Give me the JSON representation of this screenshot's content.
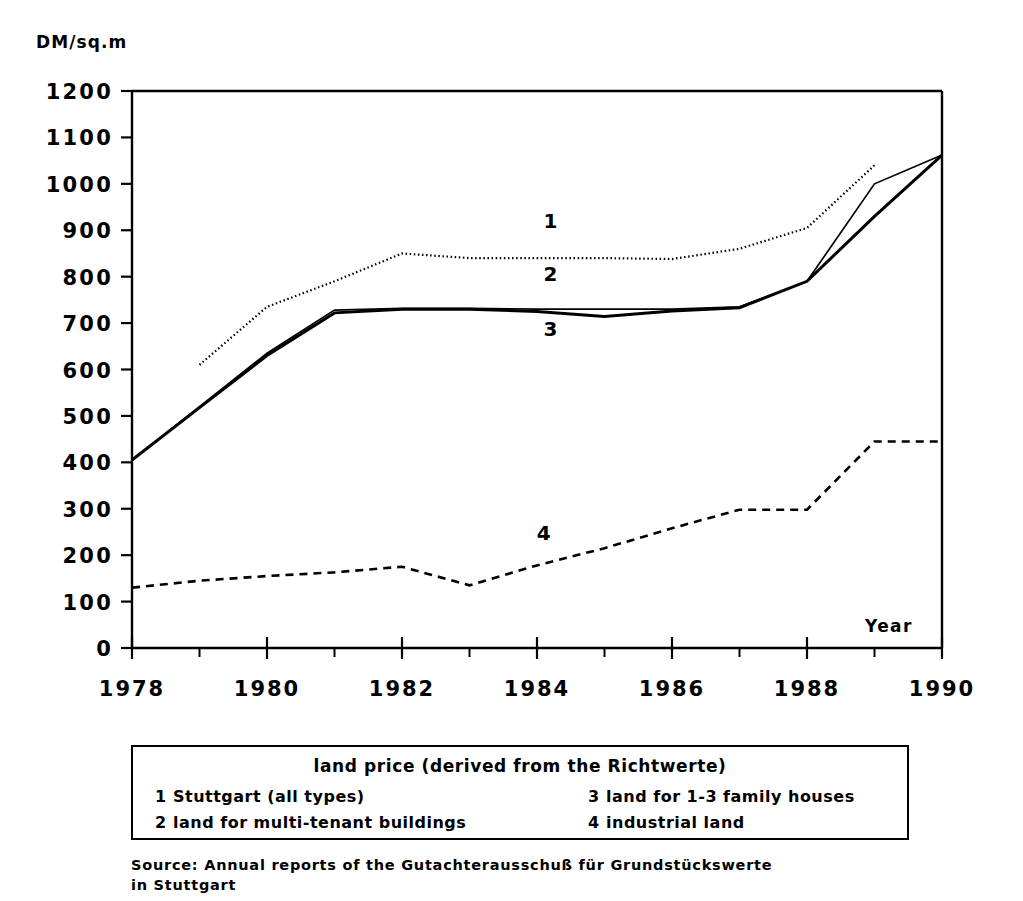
{
  "chart_data": {
    "type": "line",
    "title": "",
    "xlabel": "Year",
    "ylabel": "DM/sq.m",
    "ylim": [
      0,
      1200
    ],
    "xlim": [
      1978,
      1990
    ],
    "ytick_step": 100,
    "ytick_labels": [
      "1200",
      "1100",
      "1000",
      "900",
      "800",
      "700",
      "600",
      "500",
      "400",
      "300",
      "200",
      "100",
      "0"
    ],
    "xtick_labels": [
      "1978",
      "1980",
      "1982",
      "1984",
      "1986",
      "1988",
      "1990"
    ],
    "xtick_values": [
      1978,
      1980,
      1982,
      1984,
      1986,
      1988,
      1990
    ],
    "x_minor_ticks": [
      1979,
      1981,
      1983,
      1985,
      1987,
      1989
    ],
    "grid": false,
    "legend_position": "below-plot",
    "x": [
      1978,
      1979,
      1980,
      1981,
      1982,
      1983,
      1984,
      1985,
      1986,
      1987,
      1988,
      1989,
      1990
    ],
    "series": [
      {
        "name": "Stuttgart (all types)",
        "key": "1",
        "style": "dotted",
        "x": [
          1979,
          1980,
          1981,
          1982,
          1983,
          1984,
          1985,
          1986,
          1987,
          1988,
          1989
        ],
        "values": [
          610,
          735,
          790,
          850,
          840,
          840,
          840,
          838,
          860,
          905,
          1040
        ]
      },
      {
        "name": "land for multi-tenant buildings",
        "key": "2",
        "style": "solid-thin",
        "x": [
          1978,
          1979,
          1980,
          1981,
          1982,
          1983,
          1984,
          1985,
          1986,
          1987,
          1988,
          1989,
          1990
        ],
        "values": [
          405,
          520,
          635,
          728,
          732,
          732,
          730,
          730,
          730,
          735,
          790,
          1000,
          1062
        ]
      },
      {
        "name": "land for 1-3 family houses",
        "key": "3",
        "style": "solid-thick",
        "x": [
          1978,
          1979,
          1980,
          1981,
          1982,
          1983,
          1984,
          1985,
          1986,
          1987,
          1988,
          1989,
          1990
        ],
        "values": [
          405,
          518,
          630,
          722,
          730,
          730,
          725,
          714,
          726,
          733,
          790,
          930,
          1062
        ]
      },
      {
        "name": "industrial land",
        "key": "4",
        "style": "dashed",
        "x": [
          1978,
          1979,
          1980,
          1981,
          1982,
          1983,
          1984,
          1985,
          1986,
          1987,
          1988,
          1989,
          1990
        ],
        "values": [
          130,
          145,
          155,
          163,
          175,
          135,
          178,
          215,
          258,
          298,
          298,
          445,
          445
        ]
      }
    ],
    "inline_annotations": [
      {
        "label": "1",
        "x": 1984.2,
        "y": 905
      },
      {
        "label": "2",
        "x": 1984.2,
        "y": 790
      },
      {
        "label": "3",
        "x": 1984.2,
        "y": 672
      },
      {
        "label": "4",
        "x": 1984.1,
        "y": 232
      }
    ]
  },
  "axis": {
    "y_title": "DM/sq.m",
    "x_title": "Year"
  },
  "legend": {
    "title": "land price (derived from the Richtwerte)",
    "entries": [
      {
        "num": "1",
        "label": "Stuttgart (all types)"
      },
      {
        "num": "2",
        "label": "land for multi-tenant buildings"
      },
      {
        "num": "3",
        "label": "land for 1-3 family houses"
      },
      {
        "num": "4",
        "label": "industrial land"
      }
    ]
  },
  "source": {
    "text": "Source: Annual reports of the Gutachterausschuß für Grundstückswerte\n      in Stuttgart"
  }
}
